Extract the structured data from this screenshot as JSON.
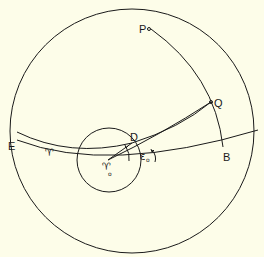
{
  "diagram": {
    "type": "celestial-sphere-geometry",
    "background": "#fdfde9",
    "line_color": "#1a1a1a",
    "labels": {
      "P": "P",
      "Q": "Q",
      "D": "D",
      "E": "E",
      "B": "B",
      "aries": "♈",
      "aries0": "♈",
      "aries0_sub": "o",
      "epsilon": "ε",
      "epsilon_sub": "o"
    },
    "points": {
      "P": [
        149,
        29
      ],
      "Q": [
        211,
        102
      ],
      "D": [
        132,
        143
      ],
      "aries0": [
        108,
        160
      ],
      "B": [
        223,
        147
      ]
    }
  }
}
